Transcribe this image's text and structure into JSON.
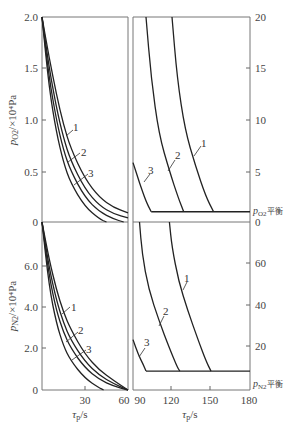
{
  "chart_data": [
    {
      "type": "line",
      "panel": "top",
      "title": "",
      "ylabel": "p_O2 / ×10^4 Pa",
      "ylabel_right": "",
      "xlabel": "",
      "left_segment": {
        "xlim": [
          0,
          60
        ],
        "ylim": [
          0,
          2.0
        ],
        "yticks": [
          0,
          0.5,
          1.0,
          1.5,
          2.0
        ],
        "ytick_labels": [
          "0",
          "0.5",
          "1.0",
          "1.5",
          "2.0"
        ],
        "series": [
          {
            "name": "1",
            "x": [
              0,
              5,
              10,
              15,
              20,
              30,
              40,
              50,
              60
            ],
            "y": [
              2.0,
              1.6,
              1.25,
              0.95,
              0.72,
              0.42,
              0.24,
              0.14,
              0.09
            ]
          },
          {
            "name": "2",
            "x": [
              0,
              5,
              10,
              15,
              20,
              30,
              40,
              50,
              60
            ],
            "y": [
              2.0,
              1.5,
              1.12,
              0.82,
              0.6,
              0.32,
              0.16,
              0.08,
              0.04
            ]
          },
          {
            "name": "3",
            "x": [
              0,
              5,
              10,
              15,
              20,
              30,
              40,
              50,
              57
            ],
            "y": [
              2.0,
              1.4,
              1.0,
              0.7,
              0.5,
              0.24,
              0.1,
              0.03,
              0.0
            ]
          },
          {
            "name": "",
            "x": [
              0,
              5,
              10,
              15,
              20,
              30,
              40,
              45
            ],
            "y": [
              2.0,
              1.3,
              0.88,
              0.58,
              0.38,
              0.15,
              0.03,
              0.0
            ]
          }
        ]
      },
      "right_segment": {
        "xlim": [
          90,
          180
        ],
        "ylim": [
          0,
          20
        ],
        "yticks": [
          5,
          10,
          15,
          20
        ],
        "ytick_labels": [
          "5",
          "10",
          "15",
          "20"
        ],
        "equilibrium_label": "p_O2平衡",
        "equilibrium_value": 1.0,
        "series": [
          {
            "name": "1",
            "x": [
              120,
              124,
              130,
              138,
              146,
              152
            ],
            "y": [
              20,
              14,
              9,
              5.5,
              2.5,
              1.0
            ]
          },
          {
            "name": "2",
            "x": [
              100,
              104,
              110,
              118,
              125,
              129
            ],
            "y": [
              20,
              14,
              8.5,
              5,
              2.3,
              1.0
            ]
          },
          {
            "name": "3",
            "x": [
              90,
              95,
              100,
              104
            ],
            "y": [
              5.8,
              3.8,
              2.0,
              1.0
            ]
          }
        ]
      }
    },
    {
      "type": "line",
      "panel": "bottom",
      "ylabel": "p_N2 / ×10^4 Pa",
      "xlabel": "τ_p/s",
      "left_segment": {
        "xlim": [
          0,
          60
        ],
        "ylim": [
          0,
          8.0
        ],
        "xticks": [
          30,
          60
        ],
        "xtick_labels": [
          "30",
          "60"
        ],
        "yticks": [
          0,
          2.0,
          4.0,
          6.0,
          8.0
        ],
        "ytick_labels": [
          "0",
          "2.0",
          "4.0",
          "6.0",
          "0"
        ],
        "series": [
          {
            "name": "1",
            "x": [
              0,
              5,
              10,
              15,
              20,
              30,
              40,
              50,
              60
            ],
            "y": [
              8.0,
              6.2,
              4.8,
              3.7,
              2.9,
              1.7,
              0.95,
              0.45,
              0.0
            ]
          },
          {
            "name": "2",
            "x": [
              0,
              5,
              10,
              15,
              20,
              30,
              40,
              50,
              60
            ],
            "y": [
              8.0,
              5.8,
              4.3,
              3.2,
              2.4,
              1.35,
              0.7,
              0.3,
              0.0
            ]
          },
          {
            "name": "3",
            "x": [
              0,
              5,
              10,
              15,
              20,
              30,
              40,
              50,
              60
            ],
            "y": [
              8.0,
              5.4,
              3.8,
              2.75,
              2.0,
              1.05,
              0.5,
              0.18,
              0.0
            ]
          },
          {
            "name": "",
            "x": [
              0,
              5,
              10,
              15,
              20,
              30,
              40,
              43
            ],
            "y": [
              8.0,
              4.9,
              3.2,
              2.1,
              1.4,
              0.55,
              0.1,
              0.0
            ]
          }
        ]
      },
      "right_segment": {
        "xlim": [
          90,
          180
        ],
        "ylim": [
          0,
          80
        ],
        "xticks": [
          90,
          120,
          150,
          180
        ],
        "xtick_labels": [
          "90",
          "120",
          "150",
          "180"
        ],
        "yticks": [
          20,
          40,
          60
        ],
        "ytick_labels": [
          "20",
          "40",
          "60"
        ],
        "top_label": "0",
        "equilibrium_label": "p_N2平衡",
        "equilibrium_value": 9,
        "series": [
          {
            "name": "1",
            "x": [
              118,
              120,
              125,
              132,
              140,
              146,
              150
            ],
            "y": [
              80,
              68,
              52,
              38,
              24,
              14,
              9
            ]
          },
          {
            "name": "2",
            "x": [
              95,
              97,
              102,
              110,
              118,
              124,
              126
            ],
            "y": [
              80,
              65,
              48,
              33,
              20,
              11,
              9
            ]
          },
          {
            "name": "3",
            "x": [
              90,
              94,
              98,
              100
            ],
            "y": [
              24,
              17,
              12,
              9
            ]
          }
        ]
      }
    }
  ],
  "labels": {
    "top_y_axis": "p",
    "top_y_sub": "O2",
    "top_y_unit": "/×10⁴Pa",
    "bottom_y_axis": "p",
    "bottom_y_sub": "N2",
    "bottom_y_unit": "/×10⁴Pa",
    "x_axis_left": "τ",
    "x_axis_sub": "p",
    "x_axis_unit": "/s",
    "eq_o2": "p",
    "eq_o2_sub": "O2",
    "eq_o2_suffix": "平衡",
    "eq_n2": "p",
    "eq_n2_sub": "N2",
    "eq_n2_suffix": "平衡",
    "curve_1": "1",
    "curve_2": "2",
    "curve_3": "3",
    "top_left_ticks": [
      "2.0",
      "1.5",
      "1.0",
      "0.5",
      "0"
    ],
    "top_right_ticks": [
      "20",
      "15",
      "10",
      "5",
      "0"
    ],
    "bottom_left_ticks": [
      "0",
      "6.0",
      "4.0",
      "2.0",
      "0"
    ],
    "bottom_right_ticks": [
      "60",
      "40",
      "20"
    ],
    "bottom_x_ticks_left": [
      "30",
      "60"
    ],
    "bottom_x_ticks_right": [
      "90",
      "120",
      "150",
      "180"
    ]
  }
}
